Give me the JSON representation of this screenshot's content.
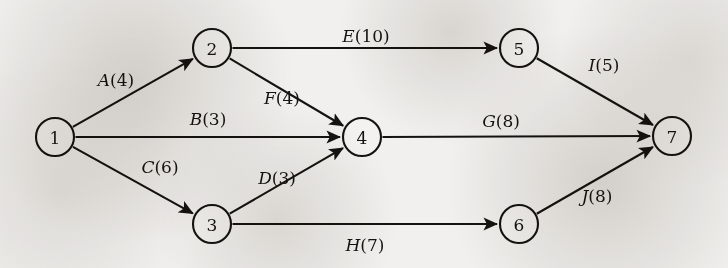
{
  "diagram": {
    "type": "directed-graph",
    "colors": {
      "ink": "#15130f",
      "paper": "#f1f0ee"
    },
    "nodes": [
      {
        "id": "1",
        "label": "1",
        "x": 55,
        "y": 137,
        "r": 19
      },
      {
        "id": "2",
        "label": "2",
        "x": 212,
        "y": 48,
        "r": 19
      },
      {
        "id": "3",
        "label": "3",
        "x": 212,
        "y": 224,
        "r": 19
      },
      {
        "id": "4",
        "label": "4",
        "x": 362,
        "y": 137,
        "r": 19
      },
      {
        "id": "5",
        "label": "5",
        "x": 519,
        "y": 48,
        "r": 19
      },
      {
        "id": "6",
        "label": "6",
        "x": 519,
        "y": 224,
        "r": 19
      },
      {
        "id": "7",
        "label": "7",
        "x": 672,
        "y": 136,
        "r": 19
      }
    ],
    "edges": [
      {
        "id": "A",
        "activity": "A",
        "duration": 4,
        "label": "A(4)",
        "from": "1",
        "to": "2",
        "label_x": 116,
        "label_y": 80
      },
      {
        "id": "B",
        "activity": "B",
        "duration": 3,
        "label": "B(3)",
        "from": "1",
        "to": "4",
        "label_x": 208,
        "label_y": 119
      },
      {
        "id": "C",
        "activity": "C",
        "duration": 6,
        "label": "C(6)",
        "from": "1",
        "to": "3",
        "label_x": 160,
        "label_y": 167
      },
      {
        "id": "D",
        "activity": "D",
        "duration": 3,
        "label": "D(3)",
        "from": "3",
        "to": "4",
        "label_x": 277,
        "label_y": 178
      },
      {
        "id": "E",
        "activity": "E",
        "duration": 10,
        "label": "E(10)",
        "from": "2",
        "to": "5",
        "label_x": 366,
        "label_y": 36
      },
      {
        "id": "F",
        "activity": "F",
        "duration": 4,
        "label": "F(4)",
        "from": "2",
        "to": "4",
        "label_x": 282,
        "label_y": 98
      },
      {
        "id": "G",
        "activity": "G",
        "duration": 8,
        "label": "G(8)",
        "from": "4",
        "to": "7",
        "label_x": 501,
        "label_y": 121
      },
      {
        "id": "H",
        "activity": "H",
        "duration": 7,
        "label": "H(7)",
        "from": "3",
        "to": "6",
        "label_x": 365,
        "label_y": 245
      },
      {
        "id": "I",
        "activity": "I",
        "duration": 5,
        "label": "I(5)",
        "from": "5",
        "to": "7",
        "label_x": 604,
        "label_y": 65
      },
      {
        "id": "J",
        "activity": "J",
        "duration": 8,
        "label": "J(8)",
        "from": "6",
        "to": "7",
        "label_x": 597,
        "label_y": 196
      }
    ]
  }
}
